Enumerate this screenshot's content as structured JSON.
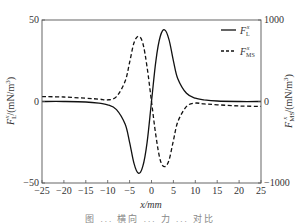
{
  "chart_data": {
    "type": "line",
    "title": "",
    "xlabel": "x/mm",
    "ylabel_left": "F_L^x/(mN/m^3)",
    "ylabel_right": "F_MS^x/(mN/m^3)",
    "xlim": [
      -25,
      25
    ],
    "ylim_left": [
      -50,
      50
    ],
    "ylim_right": [
      -1000,
      1000
    ],
    "x_ticks": [
      -25,
      -20,
      -15,
      -10,
      -5,
      0,
      5,
      10,
      15,
      20,
      25
    ],
    "y_ticks_left": [
      -50,
      0,
      50
    ],
    "y_ticks_right": [
      -1000,
      0,
      1000
    ],
    "grid": false,
    "legend_position": "upper right",
    "series": [
      {
        "name": "F_L^x",
        "axis": "left",
        "style": "solid",
        "x": [
          -25,
          -20,
          -15,
          -12,
          -10,
          -8,
          -6,
          -5,
          -4,
          -3,
          -2,
          -1,
          0,
          1,
          2,
          3,
          4,
          5,
          6,
          8,
          10,
          12,
          15,
          20,
          25
        ],
        "y": [
          0,
          0,
          -0.3,
          -1,
          -2,
          -5,
          -14,
          -25,
          -38,
          -44,
          -40,
          -25,
          0,
          25,
          40,
          44,
          38,
          25,
          14,
          5,
          2,
          1,
          0.3,
          0,
          0
        ]
      },
      {
        "name": "F_MS^x",
        "axis": "right",
        "style": "dashed",
        "x": [
          -25,
          -20,
          -15,
          -12,
          -10,
          -8,
          -6,
          -5,
          -4,
          -3,
          -2,
          -1,
          0,
          1,
          2,
          3,
          4,
          5,
          6,
          8,
          10,
          12,
          15,
          20,
          25
        ],
        "y": [
          60,
          55,
          40,
          30,
          20,
          60,
          250,
          480,
          720,
          800,
          720,
          420,
          0,
          -420,
          -720,
          -800,
          -720,
          -480,
          -250,
          -60,
          -20,
          -30,
          -40,
          -55,
          -60
        ]
      }
    ]
  },
  "labels": {
    "x_axis": "x/mm",
    "left_axis": "F",
    "left_axis_sub": "L",
    "left_axis_sup": "x",
    "left_axis_unit": "/(mN/m",
    "right_axis": "F",
    "right_axis_sub": "MS",
    "right_axis_sup": "x",
    "right_axis_unit": "/(mN/m",
    "legend_solid_main": "F",
    "legend_solid_sub": "L",
    "legend_solid_sup": "x",
    "legend_dashed_main": "F",
    "legend_dashed_sub": "MS",
    "legend_dashed_sup": "x"
  },
  "caption": "图 ... 横向 ... 力 ... 对比"
}
